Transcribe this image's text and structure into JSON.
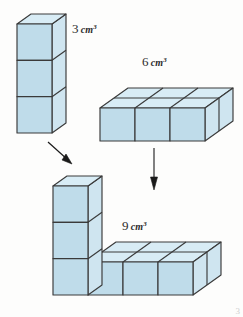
{
  "figure": {
    "background_color": "#fdfdfc",
    "palette": {
      "front_face": "#bfdcea",
      "top_face": "#d8ecf5",
      "side_face": "#cfe5f0",
      "edge_stroke": "#3a3a3a",
      "arrow_color": "#1a1a1a",
      "label_color": "#2b2b2b"
    },
    "labels": [
      {
        "id": "label-3",
        "number": "3",
        "unit": "cm",
        "exponent": "3",
        "full_text": "3 cm³"
      },
      {
        "id": "label-6",
        "number": "6",
        "unit": "cm",
        "exponent": "3",
        "full_text": "6 cm³"
      },
      {
        "id": "label-9",
        "number": "9",
        "unit": "cm",
        "exponent": "3",
        "full_text": "9 cm³"
      }
    ],
    "solids": [
      {
        "name": "column-solid",
        "volume": "3 cm³",
        "cube_count": 3,
        "dimensions": {
          "width": 1,
          "depth": 1,
          "height": 3
        },
        "position": "top-left"
      },
      {
        "name": "slab-solid",
        "volume": "6 cm³",
        "cube_count": 6,
        "dimensions": {
          "width": 3,
          "depth": 2,
          "height": 1
        },
        "position": "top-right"
      },
      {
        "name": "composite-l-solid",
        "volume": "9 cm³",
        "cube_count": 9,
        "dimensions": {
          "description": "L-shape: 1x1x3 column joined to 3x2x1 slab"
        },
        "position": "bottom"
      }
    ],
    "arrows": [
      {
        "name": "arrow-column-to-composite",
        "direction": "down-right",
        "from": "column-solid",
        "to": "composite-l-solid"
      },
      {
        "name": "arrow-slab-to-composite",
        "direction": "down",
        "from": "slab-solid",
        "to": "composite-l-solid"
      }
    ],
    "corner_mark": "3"
  }
}
